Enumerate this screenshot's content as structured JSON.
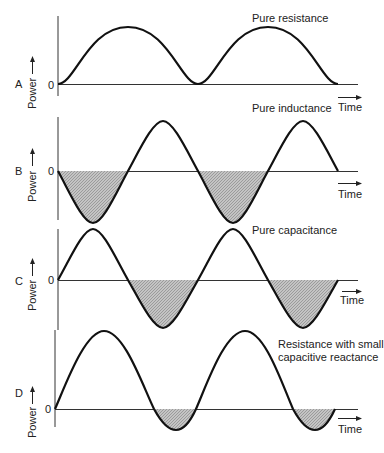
{
  "axes": {
    "y_label": "Power",
    "x_label": "Time",
    "zero_label": "0"
  },
  "panels": [
    {
      "id": "A",
      "label": "A",
      "caption": [
        "Pure resistance"
      ],
      "description": "Power always positive; sin² waveform between 0 and peak"
    },
    {
      "id": "B",
      "label": "B",
      "caption": [
        "Pure inductance"
      ],
      "description": "Power alternates equally positive/negative; starts going negative (shaded)"
    },
    {
      "id": "C",
      "label": "C",
      "caption": [
        "Pure capacitance"
      ],
      "description": "Power alternates equally positive/negative; starts going positive, negative lobes shaded"
    },
    {
      "id": "D",
      "label": "D",
      "caption": [
        "Resistance with small",
        "capacitive reactance"
      ],
      "description": "Power mostly positive with small negative shaded lobes"
    }
  ],
  "colors": {
    "curve": "#111111",
    "axis": "#333333",
    "shade": "#b8b8b8",
    "background": "#ffffff"
  }
}
